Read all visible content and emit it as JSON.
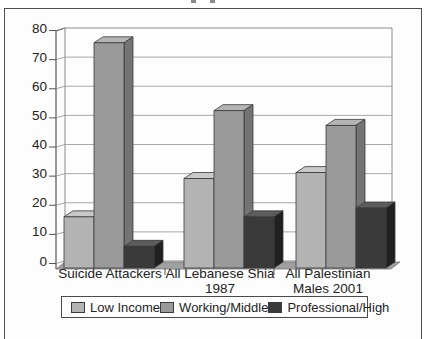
{
  "chart_data": {
    "type": "bar",
    "projection": "3d",
    "categories": [
      "Suicide Attackers",
      "All Lebanese Shia 1987",
      "All Palestinian Males 2001"
    ],
    "category_label_lines": [
      [
        "Suicide Attackers"
      ],
      [
        "All Lebanese Shia",
        "1987"
      ],
      [
        "All Palestinian",
        "Males 2001"
      ]
    ],
    "series": [
      {
        "name": "Low Income",
        "values": [
          17,
          30,
          32
        ],
        "color": "#b3b3b3",
        "top_color": "#c9c9c9",
        "side_color": "#8c8c8c"
      },
      {
        "name": "Working/Middle",
        "values": [
          76,
          53,
          48
        ],
        "color": "#9a9a9a",
        "top_color": "#b5b5b5",
        "side_color": "#747474"
      },
      {
        "name": "Professional/High",
        "values": [
          7,
          17,
          20
        ],
        "color": "#3a3a3a",
        "top_color": "#5c5c5c",
        "side_color": "#202020"
      }
    ],
    "ylim": [
      0,
      80
    ],
    "yticks": [
      "0",
      "10",
      "20",
      "30",
      "40",
      "50",
      "60",
      "70",
      "80"
    ],
    "grid": true,
    "legend_position": "bottom",
    "wall_color": "#fdfdfd",
    "floor_color": "#a0a0a0",
    "gridline_color": "#9e9e9e",
    "axis_color": "#555555"
  }
}
